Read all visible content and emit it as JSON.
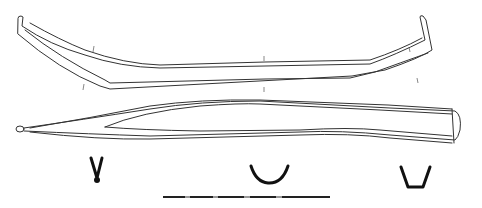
{
  "figure": {
    "colors": {
      "line": "#333333",
      "section_fill": "#111111",
      "background": "#ffffff"
    },
    "views": [
      {
        "id": "side-profile",
        "label": ""
      },
      {
        "id": "plan-view",
        "label": ""
      }
    ],
    "cross_sections": [
      {
        "id": "section-1",
        "shape": "V"
      },
      {
        "id": "section-2",
        "shape": "U"
      },
      {
        "id": "section-3",
        "shape": "trapezoid"
      }
    ],
    "scale_bar": {
      "segments": 5,
      "label": ""
    }
  }
}
